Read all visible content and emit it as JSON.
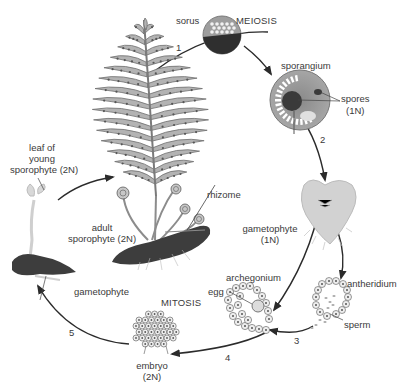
{
  "diagram": {
    "labels": {
      "sorus": "sorus",
      "meiosis": "MEIOSIS",
      "sporangium": "sporangium",
      "spores": "spores",
      "spores_ploidy": "(1N)",
      "leaf_young_1": "leaf of",
      "leaf_young_2": "young",
      "leaf_young_3": "sporophyte (2N)",
      "rhizome": "rhizome",
      "adult_1": "adult",
      "adult_2": "sporophyte (2N)",
      "gametophyte_small": "gametophyte",
      "gametophyte_main": "gametophyte",
      "gametophyte_ploidy": "(1N)",
      "archegonium": "archegonium",
      "egg": "egg",
      "antheridium": "antheridium",
      "sperm": "sperm",
      "mitosis": "MITOSIS",
      "embryo": "embryo",
      "embryo_ploidy": "(2N)"
    },
    "steps": [
      "1",
      "2",
      "3",
      "4",
      "5"
    ],
    "colors": {
      "frond": "#b3b3b3",
      "frond_outline": "#6e6e6e",
      "rhizome": "#3d3d3d",
      "sporangium": "#9a9a9a",
      "gametophyte": "#d2d2d2",
      "arrow": "#2b2b2b"
    }
  }
}
